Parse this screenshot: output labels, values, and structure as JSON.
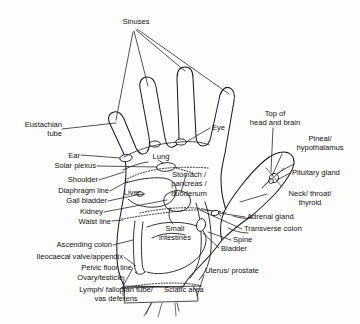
{
  "diagram": {
    "type": "reflexology-hand-map",
    "view": "left hand, palmar surface",
    "colors": {
      "background": "#fdfdfc",
      "outline": "#1c1c1c",
      "text": "#111111",
      "fill": "#ffffff"
    }
  },
  "labels": {
    "sinuses": "Sinuses",
    "eustachian_tube": "Eustachian\ntube",
    "ear": "Ear",
    "solar_plexus": "Solar plexus",
    "shoulder": "Shoulder",
    "diaphragm_line": "Diaphragm line",
    "gall_bladder": "Gall bladder",
    "kidney": "Kidney",
    "waist_line": "Waist line",
    "ascending_colon": "Ascending colon",
    "ileocaecal_valve_appendix": "Ileocaecal valve/appendix",
    "pelvic_floor_line": "Pelvic floor line",
    "ovary_testicle": "Ovary/testicle",
    "lymph_fallopian_vas": "Lymph/ fallopian tube/\nvas deferens",
    "sciatic_area": "Sciatic area",
    "uterus_prostate": "Uterus/ prostate",
    "bladder": "Bladder",
    "spine": "Spine",
    "transverse_colon": "Transverse colon",
    "adrenal_gland": "Adrenal gland",
    "neck_throat_thyroid": "Neck/ throat/\nthyroid",
    "pituitary_gland": "Pituitary gland",
    "pineal_hypothalamus": "Pineal/\nhypothalamus",
    "top_of_head_and_brain": "Top of\nhead and brain",
    "eye": "Eye",
    "lung": "Lung",
    "stomach_pancreas_duodenum": "Stomach /\npancreas /\nduodenum",
    "liver": "Liver",
    "small_intestines": "Small\nintestines"
  }
}
